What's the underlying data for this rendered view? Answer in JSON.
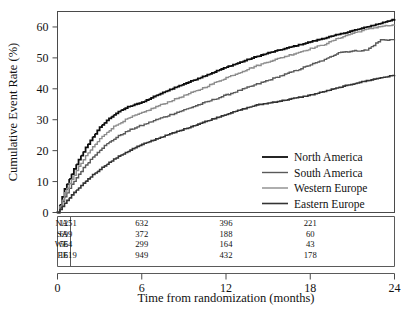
{
  "chart_data": {
    "type": "line",
    "title": "",
    "xlabel": "Time from randomization (months)",
    "ylabel": "Cumulative Event Rate (%)",
    "xlim": [
      0,
      24
    ],
    "ylim": [
      0,
      65
    ],
    "xticks": [
      "0",
      "6",
      "12",
      "18",
      "24"
    ],
    "xtick_values": [
      0,
      6,
      12,
      18,
      24
    ],
    "yticks": [
      "0",
      "10",
      "20",
      "30",
      "40",
      "50",
      "60"
    ],
    "ytick_values": [
      0,
      10,
      20,
      30,
      40,
      50,
      60
    ],
    "grid": false,
    "legend_position": "lower-right-inside",
    "x": [
      0,
      0.5,
      1,
      1.5,
      2,
      2.5,
      3,
      3.5,
      4,
      4.5,
      5,
      5.5,
      6,
      7,
      8,
      9,
      10,
      11,
      12,
      13,
      14,
      15,
      16,
      17,
      18,
      19,
      20,
      21,
      22,
      23,
      24
    ],
    "series": [
      {
        "name": "North America",
        "color": "#0d0d0d",
        "values": [
          0,
          7.5,
          12.5,
          17.0,
          21.0,
          24.5,
          27.5,
          29.8,
          31.6,
          33.0,
          34.2,
          35.0,
          35.6,
          37.8,
          39.8,
          41.6,
          43.4,
          45.2,
          47.0,
          48.6,
          50.2,
          51.6,
          52.8,
          54.0,
          55.2,
          56.4,
          57.6,
          58.8,
          60.0,
          61.2,
          62.6
        ]
      },
      {
        "name": "South America",
        "color": "#595959",
        "values": [
          0,
          5.0,
          9.0,
          12.4,
          15.4,
          18.0,
          20.3,
          22.2,
          23.8,
          25.2,
          26.4,
          27.4,
          28.2,
          30.0,
          31.6,
          33.2,
          34.8,
          36.4,
          38.0,
          39.6,
          41.2,
          42.8,
          44.4,
          46.0,
          47.8,
          49.4,
          51.8,
          52.2,
          52.5,
          55.8,
          55.9
        ]
      },
      {
        "name": "Western Europe",
        "color": "#8c8c8c",
        "values": [
          0,
          6.2,
          10.8,
          14.8,
          18.2,
          21.2,
          23.8,
          26.0,
          27.8,
          29.2,
          30.4,
          31.4,
          32.2,
          34.2,
          36.0,
          37.8,
          39.6,
          41.6,
          43.6,
          45.4,
          47.2,
          48.8,
          50.2,
          51.6,
          53.0,
          54.4,
          56.4,
          58.0,
          59.2,
          60.2,
          60.6
        ]
      },
      {
        "name": "Eastern Europe",
        "color": "#333333",
        "values": [
          0,
          3.0,
          5.6,
          8.0,
          10.2,
          12.2,
          14.0,
          15.7,
          17.2,
          18.6,
          19.8,
          21.0,
          22.0,
          23.8,
          25.4,
          27.0,
          28.6,
          30.2,
          31.8,
          33.2,
          34.6,
          35.4,
          36.2,
          37.1,
          38.0,
          39.2,
          40.4,
          41.6,
          42.6,
          43.6,
          44.4
        ]
      }
    ]
  },
  "legend": {
    "items": [
      {
        "label": "North America"
      },
      {
        "label": "South America"
      },
      {
        "label": "Western Europe"
      },
      {
        "label": "Eastern Europe"
      }
    ]
  },
  "risk_table": {
    "time_points": [
      0,
      6,
      12,
      18
    ],
    "rows": [
      {
        "label": "NA",
        "counts": [
          "1251",
          "632",
          "396",
          "221"
        ]
      },
      {
        "label": "SA",
        "counts": [
          "699",
          "372",
          "188",
          "60"
        ]
      },
      {
        "label": "WE",
        "counts": [
          "564",
          "299",
          "164",
          "43"
        ]
      },
      {
        "label": "EE",
        "counts": [
          "1619",
          "949",
          "432",
          "178"
        ]
      }
    ]
  }
}
